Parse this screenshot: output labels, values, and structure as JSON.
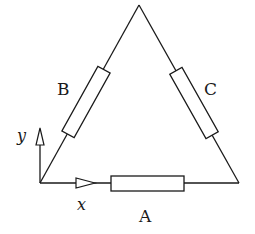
{
  "diagram": {
    "type": "triangle resistor network with coordinate axes",
    "vertices": {
      "bottom_left": [
        40,
        183
      ],
      "apex": [
        139,
        5
      ],
      "bottom_right": [
        239,
        183
      ]
    },
    "resistors": [
      {
        "id": "A",
        "label": "A",
        "side": "bottom"
      },
      {
        "id": "B",
        "label": "B",
        "side": "left"
      },
      {
        "id": "C",
        "label": "C",
        "side": "right"
      }
    ],
    "axes": {
      "x_label": "x",
      "y_label": "y"
    }
  },
  "labels": {
    "A": "A",
    "B": "B",
    "C": "C",
    "x": "x",
    "y": "y"
  },
  "colors": {
    "line": "#1a1a1a",
    "background": "#ffffff"
  }
}
